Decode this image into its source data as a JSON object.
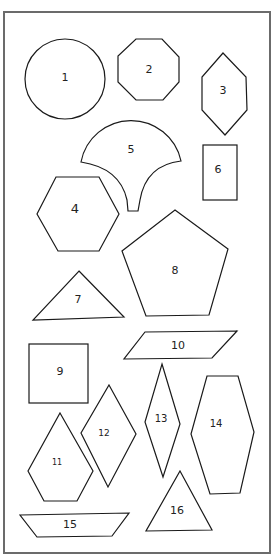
{
  "colors": {
    "stroke": "#1a1a1a",
    "frame": "#6b6b6b",
    "background": "#ffffff"
  },
  "shapes": [
    {
      "id": 1,
      "label": "1",
      "type": "circle"
    },
    {
      "id": 2,
      "label": "2",
      "type": "octagon"
    },
    {
      "id": 3,
      "label": "3",
      "type": "elongated-hexagon"
    },
    {
      "id": 4,
      "label": "4",
      "type": "hexagon"
    },
    {
      "id": 5,
      "label": "5",
      "type": "clamshell-fan"
    },
    {
      "id": 6,
      "label": "6",
      "type": "rectangle"
    },
    {
      "id": 7,
      "label": "7",
      "type": "triangle"
    },
    {
      "id": 8,
      "label": "8",
      "type": "pentagon"
    },
    {
      "id": 9,
      "label": "9",
      "type": "square"
    },
    {
      "id": 10,
      "label": "10",
      "type": "parallelogram"
    },
    {
      "id": 11,
      "label": "11",
      "type": "kite-pentagon"
    },
    {
      "id": 12,
      "label": "12",
      "type": "rhombus"
    },
    {
      "id": 13,
      "label": "13",
      "type": "narrow-rhombus"
    },
    {
      "id": 14,
      "label": "14",
      "type": "elongated-hexagon"
    },
    {
      "id": 15,
      "label": "15",
      "type": "trapezoid"
    },
    {
      "id": 16,
      "label": "16",
      "type": "triangle"
    }
  ]
}
